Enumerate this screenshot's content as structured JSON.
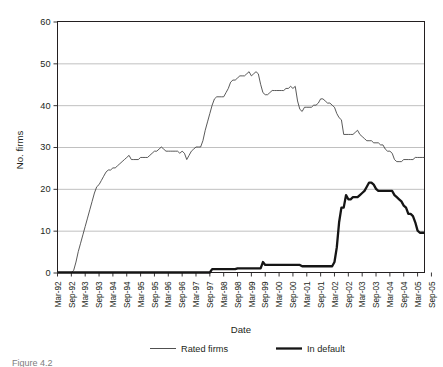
{
  "chart_data": {
    "type": "line",
    "title": "",
    "xlabel": "Date",
    "ylabel": "No. firms",
    "ylim": [
      0,
      60
    ],
    "yticks": [
      0,
      10,
      20,
      30,
      40,
      50,
      60
    ],
    "grid": "horizontal",
    "legend_position": "bottom",
    "x_tick_labels": [
      "Mar-92",
      "Sep-92",
      "Mar-93",
      "Sep-93",
      "Mar-94",
      "Sep-94",
      "Mar-95",
      "Sep-95",
      "Mar-96",
      "Sep-96",
      "Mar-97",
      "Sep-97",
      "Mar-98",
      "Sep-98",
      "Mar-99",
      "Sep-99",
      "Mar-00",
      "Sep-00",
      "Mar-01",
      "Sep-01",
      "Mar-02",
      "Sep-02",
      "Mar-03",
      "Sep-03",
      "Mar-04",
      "Sep-04",
      "Mar-05",
      "Sep-05"
    ],
    "x_range": [
      "Mar-92",
      "Sep-05"
    ],
    "x_interval_months": 1,
    "series": [
      {
        "name": "Rated firms",
        "line_style": "thin",
        "color": "#3c3c3c",
        "values": [
          0,
          0,
          0,
          0,
          0,
          0,
          0,
          0.5,
          2.5,
          5,
          7,
          9,
          11,
          13,
          15,
          17,
          19,
          20.5,
          21,
          22,
          23,
          24,
          24.5,
          24.5,
          25,
          25,
          25.5,
          26,
          26.5,
          27,
          27.5,
          28,
          27,
          27,
          27,
          27,
          27.5,
          27.5,
          27.5,
          27.5,
          28,
          28.5,
          29,
          29,
          29.5,
          30,
          29.5,
          29,
          29,
          29,
          29,
          29,
          29,
          28.5,
          29,
          28.5,
          27,
          28,
          29,
          29.5,
          30,
          30,
          30,
          31.5,
          34,
          36,
          38,
          40,
          41.5,
          42,
          42,
          42,
          42,
          43,
          44,
          45.5,
          46,
          46,
          46.5,
          47,
          47,
          47,
          47.5,
          48,
          47,
          47.5,
          48,
          47.5,
          45,
          43,
          42.5,
          42.5,
          43,
          43.5,
          43.5,
          43.5,
          43.5,
          43.5,
          43.5,
          44,
          44,
          44.5,
          44,
          44.5,
          41,
          39,
          38.5,
          39.5,
          39.5,
          39.5,
          39.5,
          40,
          40,
          40.5,
          41.5,
          41.5,
          41,
          40.5,
          40.5,
          40,
          39.5,
          38,
          37,
          36.5,
          33,
          33,
          33,
          33,
          33,
          33.5,
          34,
          33,
          32.5,
          32,
          31.5,
          31.5,
          31.5,
          31,
          31,
          31,
          30.5,
          30.5,
          29.5,
          29,
          29,
          28.5,
          27,
          26.5,
          26.5,
          26.5,
          27,
          27,
          27,
          27,
          27,
          27.5,
          27.5,
          27.5,
          27.5,
          27.5
        ]
      },
      {
        "name": "In default",
        "line_style": "thick",
        "color": "#151515",
        "values": [
          0,
          0,
          0,
          0,
          0,
          0,
          0,
          0,
          0,
          0,
          0,
          0,
          0,
          0,
          0,
          0,
          0,
          0,
          0,
          0,
          0,
          0,
          0,
          0,
          0,
          0,
          0,
          0,
          0,
          0,
          0,
          0,
          0,
          0,
          0,
          0,
          0,
          0,
          0,
          0,
          0,
          0,
          0,
          0,
          0,
          0,
          0,
          0,
          0,
          0,
          0,
          0,
          0,
          0,
          0,
          0,
          0,
          0,
          0,
          0,
          0,
          0,
          0,
          0,
          0,
          0,
          0,
          0.8,
          0.8,
          0.8,
          0.8,
          0.8,
          0.8,
          0.8,
          0.8,
          0.8,
          0.8,
          0.8,
          1,
          1,
          1,
          1,
          1,
          1,
          1,
          1,
          1,
          1,
          1,
          2.5,
          1.8,
          1.8,
          1.8,
          1.8,
          1.8,
          1.8,
          1.8,
          1.8,
          1.8,
          1.8,
          1.8,
          1.8,
          1.8,
          1.8,
          1.8,
          1.8,
          1.5,
          1.5,
          1.5,
          1.5,
          1.5,
          1.5,
          1.5,
          1.5,
          1.5,
          1.5,
          1.5,
          1.5,
          1.5,
          1.5,
          2.5,
          6,
          12,
          15.5,
          15.5,
          18.5,
          17.5,
          17.5,
          18,
          18,
          18,
          18.5,
          19,
          19.5,
          20.5,
          21.5,
          21.5,
          21,
          20,
          19.5,
          19.5,
          19.5,
          19.5,
          19.5,
          19.5,
          19.5,
          18.5,
          18,
          17.5,
          17,
          16,
          15.5,
          14,
          14,
          13.5,
          12,
          10,
          9.5,
          9.5,
          9.5
        ]
      }
    ]
  },
  "legend": {
    "items": [
      {
        "label": "Rated firms"
      },
      {
        "label": "In default"
      }
    ]
  },
  "axes": {
    "x_title": "Date",
    "y_title": "No. firms"
  },
  "caption": {
    "text": "Figure 4.2"
  }
}
